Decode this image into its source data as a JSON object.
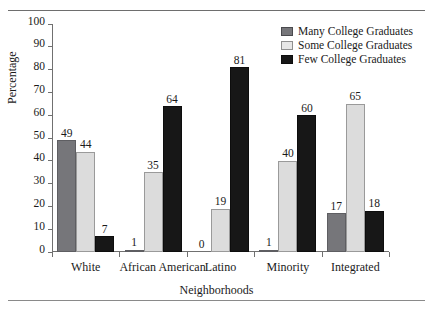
{
  "chart_data": {
    "type": "bar",
    "title": "",
    "xlabel": "Neighborhoods",
    "ylabel": "Percentage",
    "categories": [
      "White",
      "African American",
      "Latino",
      "Minority",
      "Integrated"
    ],
    "series": [
      {
        "name": "Many College Graduates",
        "color": "#76767a",
        "values": [
          49,
          1,
          0,
          1,
          17
        ]
      },
      {
        "name": "Some College Graduates",
        "color": "#dcdcdc",
        "values": [
          44,
          35,
          19,
          40,
          65
        ]
      },
      {
        "name": "Few College Graduates",
        "color": "#171717",
        "values": [
          7,
          64,
          81,
          60,
          18
        ]
      }
    ],
    "ylim": [
      0,
      100
    ],
    "yticks": [
      0,
      10,
      20,
      30,
      40,
      50,
      60,
      70,
      80,
      90,
      100
    ],
    "ytick_labels": [
      "0",
      "10",
      "20",
      "30",
      "40",
      "50",
      "60",
      "70",
      "80",
      "90",
      "100"
    ],
    "grid": false,
    "legend_position": "top-right",
    "value_labels": true
  },
  "legend": {
    "items": [
      {
        "label": "Many College Graduates",
        "swatch": "many"
      },
      {
        "label": "Some College Graduates",
        "swatch": "some"
      },
      {
        "label": "Few College Graduates",
        "swatch": "few"
      }
    ]
  }
}
